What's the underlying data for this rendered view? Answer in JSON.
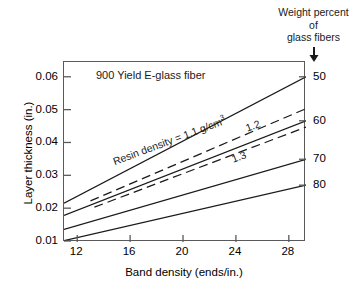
{
  "caption": {
    "line1": "Weight percent",
    "line2": "of",
    "line3": "glass fibers",
    "arrow_icon": "down-arrow-icon"
  },
  "plot_title": "900 Yield E-glass fiber",
  "annotations": {
    "resin_density": "Resin density = 1.1 g/cm",
    "resin_density_exponent": "3",
    "curve_12": "1.2",
    "curve_13": "1.3"
  },
  "chart_data": {
    "type": "line",
    "title": "900 Yield E-glass fiber",
    "xlabel": "Band density (ends/in.)",
    "ylabel": "Layer thickness (in.)",
    "xlim": [
      11.0,
      29.3
    ],
    "ylim": [
      0.0097,
      0.0645
    ],
    "xticks": [
      12,
      16,
      20,
      24,
      28
    ],
    "xtick_labels": [
      "12",
      "16",
      "20",
      "24",
      "28"
    ],
    "yticks": [
      0.01,
      0.02,
      0.03,
      0.04,
      0.05,
      0.06
    ],
    "ytick_labels": [
      "0.01",
      "0.02",
      "0.03",
      "0.04",
      "0.05",
      "0.06"
    ],
    "grid": false,
    "legend_position": "inline-labels",
    "right_axis": {
      "label": "Weight percent of glass fibers",
      "ticks": [
        50,
        60,
        70,
        80
      ],
      "tick_labels": [
        "50",
        "60",
        "70",
        "80"
      ],
      "tick_y_values": [
        0.06,
        0.0466,
        0.0349,
        0.027
      ]
    },
    "series": [
      {
        "name": "50% glass fibers",
        "right_label": "50",
        "style": "solid",
        "x": [
          11.0,
          29.3
        ],
        "y": [
          0.0215,
          0.06
        ]
      },
      {
        "name": "60% glass fibers, resin density 1.1 g/cm3",
        "right_label": "60",
        "style": "dashed",
        "x": [
          13.0,
          29.3
        ],
        "y": [
          0.0222,
          0.0503
        ]
      },
      {
        "name": "60% glass fibers, resin density 1.2 g/cm3",
        "right_label": "",
        "style": "solid",
        "x": [
          11.0,
          29.3
        ],
        "y": [
          0.0178,
          0.0466
        ]
      },
      {
        "name": "70% glass fibers, resin density 1.3 g/cm3",
        "right_label": "",
        "style": "dashed",
        "x": [
          13.3,
          29.3
        ],
        "y": [
          0.0203,
          0.0447
        ]
      },
      {
        "name": "70% glass fibers",
        "right_label": "70",
        "style": "solid",
        "x": [
          11.0,
          29.3
        ],
        "y": [
          0.0135,
          0.0349
        ]
      },
      {
        "name": "80% glass fibers",
        "right_label": "80",
        "style": "solid",
        "x": [
          11.0,
          29.3
        ],
        "y": [
          0.0101,
          0.027
        ]
      }
    ]
  },
  "colors": {
    "line": "#1a1a1a",
    "frame": "#5a5a5a",
    "text": "#1a1a1a",
    "background": "#ffffff"
  }
}
